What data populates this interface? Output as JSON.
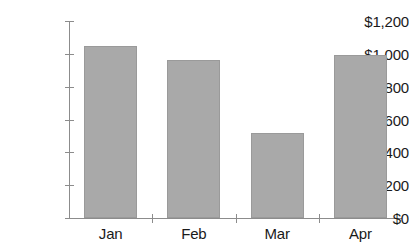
{
  "chart_data": {
    "type": "bar",
    "title": "",
    "xlabel": "",
    "ylabel": "",
    "categories": [
      "Jan",
      "Feb",
      "Mar",
      "Apr"
    ],
    "values": [
      1045,
      960,
      515,
      990
    ],
    "ylim": [
      0,
      1200
    ],
    "ytick_values": [
      0,
      200,
      400,
      600,
      800,
      1000,
      1200
    ],
    "ytick_labels": [
      "$0",
      "$200",
      "$400",
      "$600",
      "$800",
      "$1,000",
      "$1,200"
    ],
    "grid": false,
    "legend": null,
    "series": [
      {
        "name": "",
        "values": [
          1045,
          960,
          515,
          990
        ],
        "color": "#a9a9a9"
      }
    ],
    "colors": {
      "bar_fill": "#a9a9a9",
      "bar_border": "#9a9a9a",
      "axis": "#8c8c8c",
      "text": "#1a1a1a",
      "background": "#ffffff"
    }
  }
}
